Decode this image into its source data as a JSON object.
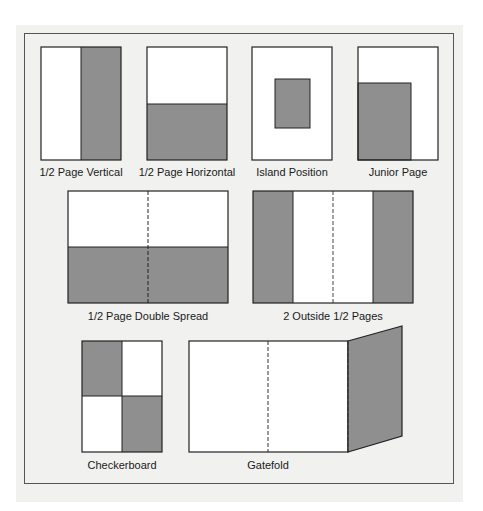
{
  "colors": {
    "ad_fill": "#8f8f8f",
    "page_fill": "#ffffff",
    "stroke": "#222222",
    "background": "#f1f1ef"
  },
  "items": [
    {
      "id": "half-page-vertical",
      "label": "1/2 Page Vertical"
    },
    {
      "id": "half-page-horizontal",
      "label": "1/2 Page Horizontal"
    },
    {
      "id": "island-position",
      "label": "Island Position"
    },
    {
      "id": "junior-page",
      "label": "Junior Page"
    },
    {
      "id": "half-page-double-spread",
      "label": "1/2 Page Double Spread"
    },
    {
      "id": "two-outside-half-pages",
      "label": "2 Outside 1/2 Pages"
    },
    {
      "id": "checkerboard",
      "label": "Checkerboard"
    },
    {
      "id": "gatefold",
      "label": "Gatefold"
    }
  ]
}
